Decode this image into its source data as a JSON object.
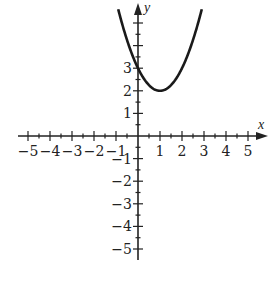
{
  "chart_data": {
    "type": "line",
    "title": "",
    "xlabel": "x",
    "ylabel": "y",
    "xlim": [
      -5,
      5
    ],
    "ylim": [
      -5,
      5
    ],
    "grid": false,
    "legend": null,
    "x_ticks": [
      -5,
      -4,
      -3,
      -2,
      -1,
      1,
      2,
      3,
      4,
      5
    ],
    "x_tick_labels": [
      "−5",
      "−4",
      "−3",
      "−2",
      "−1",
      "1",
      "2",
      "3",
      "4",
      "5"
    ],
    "y_ticks": [
      -5,
      -4,
      -3,
      -2,
      -1,
      1,
      2,
      3
    ],
    "y_tick_labels": [
      "−5",
      "−4",
      "−3",
      "−2",
      "−1",
      "1",
      "2",
      "3"
    ],
    "minor_tick_step": 0.5,
    "series": [
      {
        "name": "parabola",
        "equation": "y = (x - 1)^2 + 2",
        "vertex": [
          1,
          2
        ],
        "y_intercept": 3,
        "x": [
          -0.9,
          -0.5,
          0,
          0.5,
          1,
          1.5,
          2,
          2.5,
          2.9
        ],
        "values": [
          5.61,
          4.25,
          3,
          2.25,
          2,
          2.25,
          3,
          4.25,
          5.61
        ],
        "color": "#1a1a1a"
      }
    ]
  }
}
